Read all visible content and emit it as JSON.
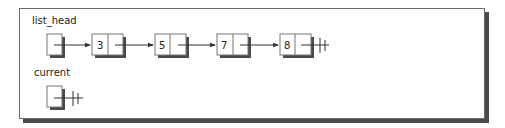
{
  "diagram": {
    "labels": {
      "list_head": "list_head",
      "current": "current"
    },
    "nodes": [
      {
        "value": "3"
      },
      {
        "value": "5"
      },
      {
        "value": "7"
      },
      {
        "value": "8"
      }
    ],
    "pointers": {
      "list_head": "points-to-node-3",
      "current": "null",
      "last_node_next": "null"
    },
    "colors": {
      "line": "#333333",
      "shadow": "#4a4a4a",
      "box_border": "#777777"
    }
  }
}
